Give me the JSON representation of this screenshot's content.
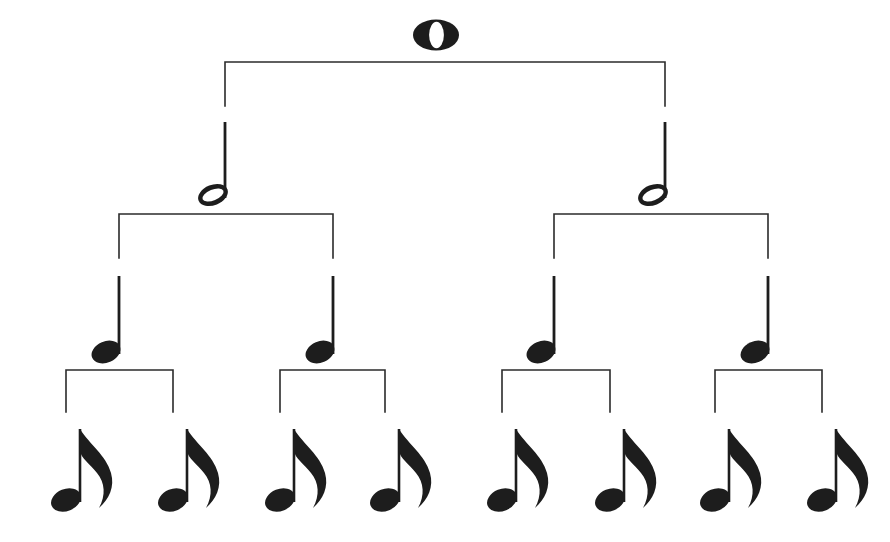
{
  "figure": {
    "background_color": "#ffffff",
    "ink_color": "#1d1d1d",
    "line_color": "#2b2b2b",
    "width": 890,
    "height": 542
  },
  "levels": [
    {
      "index": 0,
      "name": "whole-note-level",
      "note_type": "whole-note",
      "note_glyph": "whole-note-glyph",
      "count": 1,
      "value": 1,
      "label": "whole note",
      "nodes": [
        {
          "id": "w1",
          "x": 436,
          "y": 35
        }
      ]
    },
    {
      "index": 1,
      "name": "half-note-level",
      "note_type": "half-note",
      "note_glyph": "half-note-glyph",
      "count": 2,
      "value": 0.5,
      "label": "half note",
      "nodes": [
        {
          "id": "h1",
          "x": 225,
          "y": 195
        },
        {
          "id": "h2",
          "x": 665,
          "y": 195
        }
      ]
    },
    {
      "index": 2,
      "name": "quarter-note-level",
      "note_type": "quarter-note",
      "note_glyph": "quarter-note-glyph",
      "count": 4,
      "value": 0.25,
      "label": "quarter note",
      "nodes": [
        {
          "id": "q1",
          "x": 119,
          "y": 352
        },
        {
          "id": "q2",
          "x": 333,
          "y": 352
        },
        {
          "id": "q3",
          "x": 554,
          "y": 352
        },
        {
          "id": "q4",
          "x": 768,
          "y": 352
        }
      ]
    },
    {
      "index": 3,
      "name": "eighth-note-level",
      "note_type": "eighth-note",
      "note_glyph": "eighth-note-glyph",
      "count": 8,
      "value": 0.125,
      "label": "eighth note",
      "nodes": [
        {
          "id": "e1",
          "x": 66,
          "y": 500
        },
        {
          "id": "e2",
          "x": 173,
          "y": 500
        },
        {
          "id": "e3",
          "x": 280,
          "y": 500
        },
        {
          "id": "e4",
          "x": 385,
          "y": 500
        },
        {
          "id": "e5",
          "x": 502,
          "y": 500
        },
        {
          "id": "e6",
          "x": 610,
          "y": 500
        },
        {
          "id": "e7",
          "x": 715,
          "y": 500
        },
        {
          "id": "e8",
          "x": 822,
          "y": 500
        }
      ]
    }
  ],
  "brackets": [
    {
      "id": "b0",
      "name": "bracket-whole-to-halves",
      "level": 0,
      "top_y": 62,
      "left_x": 225,
      "right_x": 665,
      "drop": 44
    },
    {
      "id": "b1a",
      "name": "bracket-half1-to-quarters",
      "level": 1,
      "top_y": 214,
      "left_x": 119,
      "right_x": 333,
      "drop": 44
    },
    {
      "id": "b1b",
      "name": "bracket-half2-to-quarters",
      "level": 1,
      "top_y": 214,
      "left_x": 554,
      "right_x": 768,
      "drop": 44
    },
    {
      "id": "b2a",
      "name": "bracket-quarter1-to-eighths",
      "level": 2,
      "top_y": 370,
      "left_x": 66,
      "right_x": 173,
      "drop": 42
    },
    {
      "id": "b2b",
      "name": "bracket-quarter2-to-eighths",
      "level": 2,
      "top_y": 370,
      "left_x": 280,
      "right_x": 385,
      "drop": 42
    },
    {
      "id": "b2c",
      "name": "bracket-quarter3-to-eighths",
      "level": 2,
      "top_y": 370,
      "left_x": 502,
      "right_x": 610,
      "drop": 42
    },
    {
      "id": "b2d",
      "name": "bracket-quarter4-to-eighths",
      "level": 2,
      "top_y": 370,
      "left_x": 715,
      "right_x": 822,
      "drop": 42
    }
  ],
  "connectors": [
    {
      "id": "c-h1",
      "name": "connector-to-half-note-1",
      "x": 225,
      "y1": 122,
      "y2": 196
    },
    {
      "id": "c-h2",
      "name": "connector-to-half-note-2",
      "x": 665,
      "y1": 122,
      "y2": 196
    },
    {
      "id": "c-q1",
      "name": "connector-to-quarter-note-1",
      "x": 119,
      "y1": 276,
      "y2": 352
    },
    {
      "id": "c-q2",
      "name": "connector-to-quarter-note-2",
      "x": 333,
      "y1": 276,
      "y2": 352
    },
    {
      "id": "c-q3",
      "name": "connector-to-quarter-note-3",
      "x": 554,
      "y1": 276,
      "y2": 352
    },
    {
      "id": "c-q4",
      "name": "connector-to-quarter-note-4",
      "x": 768,
      "y1": 276,
      "y2": 352
    }
  ]
}
